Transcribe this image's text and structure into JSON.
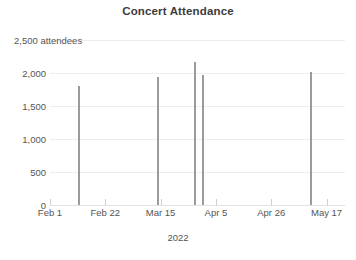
{
  "chart_data": {
    "type": "bar",
    "title": "Concert Attendance",
    "xlabel": "2022",
    "ylabel": "attendees",
    "ylim": [
      0,
      2500
    ],
    "xlim_labels": [
      "Feb 1",
      "May 17"
    ],
    "grid": true,
    "legend": "none",
    "bar_color": "#9b9b9b",
    "gridline_color": "#ededed",
    "text_color": "#555555",
    "title_color": "#3c3c3c",
    "y_ticks": [
      {
        "value": 0,
        "label": "0"
      },
      {
        "value": 500,
        "label": "500"
      },
      {
        "value": 1000,
        "label": "1,000"
      },
      {
        "value": 1500,
        "label": "1,500"
      },
      {
        "value": 2000,
        "label": "2,000"
      },
      {
        "value": 2500,
        "label": "2,500 attendees"
      }
    ],
    "x_ticks": [
      {
        "position": 0,
        "label": "Feb 1"
      },
      {
        "position": 21,
        "label": "Feb 22"
      },
      {
        "position": 42,
        "label": "Mar 15"
      },
      {
        "position": 63,
        "label": "Apr 5"
      },
      {
        "position": 84,
        "label": "Apr 26"
      },
      {
        "position": 105,
        "label": "May 17"
      }
    ],
    "x_axis_days_span": 112,
    "categories": [
      "Feb 11",
      "Mar 13",
      "Mar 27",
      "Mar 30",
      "May 10"
    ],
    "x": [
      11,
      41,
      55,
      58,
      99
    ],
    "values": [
      1800,
      1940,
      2170,
      1970,
      2020
    ],
    "bars": [
      {
        "label": "Feb 11",
        "day_offset": 11,
        "value": 1800
      },
      {
        "label": "Mar 13",
        "day_offset": 41,
        "value": 1940
      },
      {
        "label": "Mar 27",
        "day_offset": 55,
        "value": 2170
      },
      {
        "label": "Mar 30",
        "day_offset": 58,
        "value": 1970
      },
      {
        "label": "May 10",
        "day_offset": 99,
        "value": 2020
      }
    ]
  }
}
